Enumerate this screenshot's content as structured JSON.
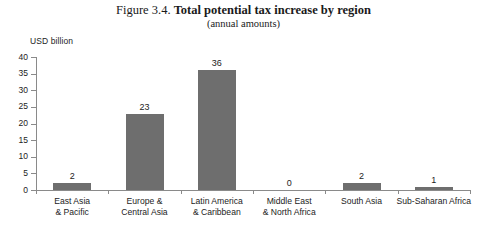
{
  "figure": {
    "number": "Figure 3.4.",
    "title": "Total potential tax increase by region",
    "subtitle": "(annual amounts)",
    "unit_label": "USD billion"
  },
  "chart_data": {
    "type": "bar",
    "title": "Figure 3.4. Total potential tax increase by region",
    "subtitle": "(annual amounts)",
    "xlabel": "",
    "ylabel": "USD billion",
    "ylim": [
      0,
      40
    ],
    "yticks": [
      0,
      5,
      10,
      15,
      20,
      25,
      30,
      35,
      40
    ],
    "ytick_labels": [
      "0",
      "5",
      "10",
      "15",
      "20",
      "25",
      "30",
      "35",
      "40"
    ],
    "grid": false,
    "legend": false,
    "bar_color": "#6e6e6e",
    "axis_color": "#8a8a8a",
    "categories": [
      "East Asia\n& Pacific",
      "Europe &\nCentral Asia",
      "Latin America\n& Caribbean",
      "Middle East\n& North Africa",
      "South Asia",
      "Sub-Saharan Africa"
    ],
    "values": [
      2,
      23,
      36,
      0,
      2,
      1
    ],
    "value_labels": [
      "2",
      "23",
      "36",
      "0",
      "2",
      "1"
    ]
  }
}
